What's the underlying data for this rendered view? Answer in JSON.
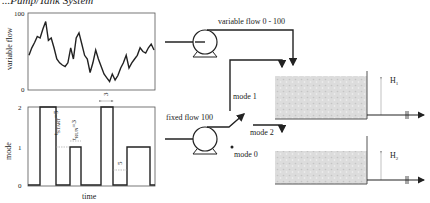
{
  "title": "...Pump/Tank System",
  "top_plot": {
    "ylabel": "variable flow",
    "y_ticks": [
      "100",
      "0"
    ],
    "series": [
      45,
      55,
      62,
      70,
      68,
      80,
      90,
      65,
      68,
      55,
      40,
      35,
      32,
      30,
      35,
      55,
      40,
      68,
      75,
      60,
      45,
      40,
      22,
      35,
      52,
      40,
      30,
      20,
      15,
      10,
      20,
      12,
      18,
      28,
      35,
      45,
      28,
      35,
      40,
      45,
      55,
      50,
      48,
      55,
      60,
      52
    ]
  },
  "bottom_plot": {
    "ylabel": "mode",
    "xlabel": "time",
    "y_ticks": [
      "2",
      "1",
      "0"
    ],
    "annotations": {
      "t_start": "t",
      "t_start_sub": "START",
      "t_start_val": "=5",
      "t_run": "t",
      "t_run_sub": "RUN",
      "t_run_val": "=3",
      "top_gap": "3",
      "bottom_gap": "5"
    }
  },
  "labels": {
    "variable_flow": "variable flow 0 - 100",
    "fixed_flow": "fixed flow 100",
    "mode1": "mode 1",
    "mode2": "mode 2",
    "mode0": "mode 0",
    "h1": "H",
    "h1_sub": "1",
    "h2": "H",
    "h2_sub": "2"
  },
  "chart_data": {
    "type": "line",
    "title": "Pump/Tank System",
    "panels": [
      {
        "ylabel": "variable flow",
        "ylim": [
          0,
          100
        ],
        "values": [
          45,
          55,
          62,
          70,
          68,
          80,
          90,
          65,
          68,
          55,
          40,
          35,
          32,
          30,
          35,
          55,
          40,
          68,
          75,
          60,
          45,
          40,
          22,
          35,
          52,
          40,
          30,
          20,
          15,
          10,
          20,
          12,
          18,
          28,
          35,
          45,
          28,
          35,
          40,
          45,
          55,
          50,
          48,
          55,
          60,
          52
        ]
      },
      {
        "ylabel": "mode",
        "xlabel": "time",
        "ylim": [
          0,
          2
        ],
        "segments": [
          0,
          2,
          2,
          0,
          0,
          1,
          0,
          0,
          2,
          0,
          0,
          1,
          1,
          0
        ]
      }
    ]
  }
}
